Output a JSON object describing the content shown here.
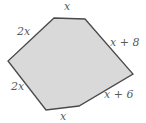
{
  "figure": {
    "shape": "hexagon",
    "fill_color": "#d9d9d9",
    "stroke_color": "#4a4a4a",
    "label_color": "#5a5a5a",
    "vertices": [
      {
        "id": "A",
        "x": 54,
        "y": 18
      },
      {
        "id": "B",
        "x": 85,
        "y": 19
      },
      {
        "id": "C",
        "x": 133,
        "y": 74
      },
      {
        "id": "D",
        "x": 79,
        "y": 106
      },
      {
        "id": "E",
        "x": 46,
        "y": 110
      },
      {
        "id": "F",
        "x": 8,
        "y": 61
      }
    ],
    "sides": [
      {
        "name": "top",
        "label": "x"
      },
      {
        "name": "upper-right",
        "label": "x + 8"
      },
      {
        "name": "lower-right",
        "label": "x + 6"
      },
      {
        "name": "bottom",
        "label": "x"
      },
      {
        "name": "lower-left",
        "label": "2x"
      },
      {
        "name": "upper-left",
        "label": "2x"
      }
    ]
  }
}
